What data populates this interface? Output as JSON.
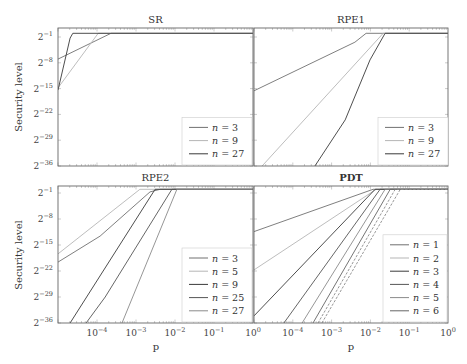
{
  "figure": {
    "ylabel": "Security level",
    "xlabel": "p"
  },
  "chart_data": [
    {
      "type": "line",
      "title": "SR",
      "xlabel": "",
      "ylabel": "Security level",
      "xscale": "log10",
      "yscale": "log2",
      "xlim_log10": [
        -5,
        0
      ],
      "ylim_log2": [
        -36,
        1.4
      ],
      "x_tick_labels": [],
      "y_tick_labels": [
        "2^-1",
        "2^-8",
        "2^-15",
        "2^-22",
        "2^-29",
        "2^-36"
      ],
      "legend_position": "lower right",
      "series": [
        {
          "name": "n = 3",
          "color": "#707070",
          "dash": false,
          "points": [
            [
              -5,
              -7.0
            ],
            [
              -3.64,
              0
            ],
            [
              0,
              0
            ]
          ]
        },
        {
          "name": "n = 9",
          "color": "#b5b5b5",
          "dash": false,
          "points": [
            [
              -5,
              -14.8
            ],
            [
              -3.97,
              0
            ],
            [
              0,
              0
            ]
          ]
        },
        {
          "name": "n = 27",
          "color": "#3a3a3a",
          "dash": false,
          "points": [
            [
              -5,
              -15.4
            ],
            [
              -4.69,
              -1.3
            ],
            [
              -4.62,
              0
            ],
            [
              0,
              0
            ]
          ]
        }
      ]
    },
    {
      "type": "line",
      "title": "RPE1",
      "xlabel": "",
      "ylabel": "",
      "xscale": "log10",
      "yscale": "log2",
      "xlim_log10": [
        -5,
        0
      ],
      "ylim_log2": [
        -36,
        1.4
      ],
      "x_tick_labels": [],
      "y_tick_labels": [],
      "legend_position": "lower right",
      "series": [
        {
          "name": "n = 3",
          "color": "#707070",
          "dash": false,
          "points": [
            [
              -5,
              -15.6
            ],
            [
              -2.4,
              -2.4
            ],
            [
              -2.11,
              0
            ],
            [
              0,
              0
            ]
          ]
        },
        {
          "name": "n = 9",
          "color": "#b5b5b5",
          "dash": false,
          "points": [
            [
              -4.79,
              -36
            ],
            [
              -1.67,
              0
            ],
            [
              0,
              0
            ]
          ]
        },
        {
          "name": "n = 27",
          "color": "#3a3a3a",
          "dash": false,
          "points": [
            [
              -3.43,
              -36
            ],
            [
              -2.65,
              -23.5
            ],
            [
              -2.01,
              -7.2
            ],
            [
              -1.62,
              0
            ],
            [
              0,
              0
            ]
          ]
        }
      ]
    },
    {
      "type": "line",
      "title": "RPE2",
      "xlabel": "p",
      "ylabel": "Security level",
      "xscale": "log10",
      "yscale": "log2",
      "xlim_log10": [
        -5,
        0
      ],
      "ylim_log2": [
        -36,
        1.4
      ],
      "x_tick_labels": [
        "10^-4",
        "10^-3",
        "10^-2",
        "10^-1",
        "10^0"
      ],
      "y_tick_labels": [
        "2^-1",
        "2^-8",
        "2^-15",
        "2^-22",
        "2^-29",
        "2^-36"
      ],
      "legend_position": "lower right",
      "series": [
        {
          "name": "n = 3",
          "color": "#707070",
          "dash": false,
          "points": [
            [
              -5,
              -19.6
            ],
            [
              -3.92,
              -12.6
            ],
            [
              -2.64,
              -0.7
            ],
            [
              -2.38,
              0
            ],
            [
              0,
              0
            ]
          ]
        },
        {
          "name": "n = 5",
          "color": "#b5b5b5",
          "dash": false,
          "points": [
            [
              -5,
              -17.4
            ],
            [
              -2.9,
              0
            ],
            [
              0,
              0
            ]
          ]
        },
        {
          "name": "n = 9",
          "color": "#3a3a3a",
          "dash": false,
          "points": [
            [
              -4.69,
              -36
            ],
            [
              -2.51,
              0
            ],
            [
              0,
              0
            ]
          ]
        },
        {
          "name": "n = 25",
          "color": "#555555",
          "dash": false,
          "points": [
            [
              -4.28,
              -36
            ],
            [
              -3.79,
              -29
            ],
            [
              -2.08,
              0
            ],
            [
              0,
              0
            ]
          ]
        },
        {
          "name": "n = 27",
          "color": "#8a8a8a",
          "dash": false,
          "points": [
            [
              -3.36,
              -36
            ],
            [
              -1.95,
              0
            ],
            [
              0,
              0
            ]
          ]
        }
      ]
    },
    {
      "type": "line",
      "title": "PDT",
      "xlabel": "p",
      "ylabel": "",
      "xscale": "log10",
      "yscale": "log2",
      "xlim_log10": [
        -5,
        0
      ],
      "ylim_log2": [
        -36,
        1.4
      ],
      "x_tick_labels": [
        "10^-4",
        "10^-3",
        "10^-2",
        "10^-1",
        "10^0"
      ],
      "y_tick_labels": [],
      "legend_position": "lower right",
      "series": [
        {
          "name": "n = 1",
          "color": "#707070",
          "dash": false,
          "points": [
            [
              -5,
              -11.4
            ],
            [
              -1.93,
              0
            ],
            [
              0,
              0
            ]
          ]
        },
        {
          "name": "n = 2",
          "color": "#b5b5b5",
          "dash": false,
          "points": [
            [
              -5,
              -21.7
            ],
            [
              -1.85,
              0
            ],
            [
              0,
              0
            ]
          ]
        },
        {
          "name": "n = 3",
          "color": "#3a3a3a",
          "dash": false,
          "points": [
            [
              -5,
              -34.1
            ],
            [
              -1.88,
              0
            ],
            [
              0,
              0
            ]
          ]
        },
        {
          "name": "n = 4",
          "color": "#555555",
          "dash": false,
          "points": [
            [
              -4.23,
              -36
            ],
            [
              -1.75,
              0
            ],
            [
              0,
              0
            ]
          ]
        },
        {
          "name": "n = 5",
          "color": "#8a8a8a",
          "dash": false,
          "points": [
            [
              -3.76,
              -36
            ],
            [
              -1.62,
              0
            ],
            [
              0,
              0
            ]
          ]
        },
        {
          "name": "n = 6",
          "color": "#656565",
          "dash": false,
          "points": [
            [
              -3.48,
              -36
            ],
            [
              -1.49,
              0
            ],
            [
              0,
              0
            ]
          ]
        },
        {
          "name": "",
          "color": "#8a8a8a",
          "dash": true,
          "points": [
            [
              -3.35,
              -36
            ],
            [
              -1.36,
              0
            ],
            [
              0,
              0
            ]
          ]
        },
        {
          "name": "",
          "color": "#8a8a8a",
          "dash": true,
          "points": [
            [
              -3.25,
              -36
            ],
            [
              -1.23,
              0
            ],
            [
              0,
              0
            ]
          ]
        }
      ]
    }
  ]
}
